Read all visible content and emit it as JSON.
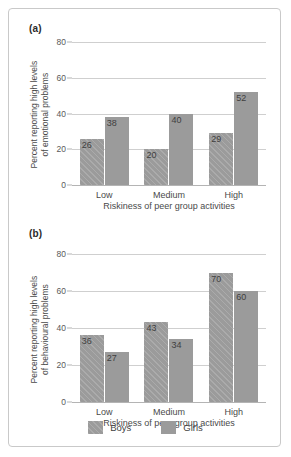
{
  "figure": {
    "panel_a_tag": "(a)",
    "panel_b_tag": "(b)",
    "legend": {
      "items": [
        {
          "label": "Boys",
          "color": "#9b9b9b",
          "pattern": "diagonal-hatch"
        },
        {
          "label": "Girls",
          "color": "#9b9b9b",
          "pattern": "solid"
        }
      ]
    }
  },
  "chart_data": [
    {
      "type": "bar",
      "panel": "(a)",
      "title": "",
      "categories": [
        "Low",
        "Medium",
        "High"
      ],
      "series": [
        {
          "name": "Boys",
          "values": [
            26,
            20,
            29
          ]
        },
        {
          "name": "Girls",
          "values": [
            38,
            40,
            52
          ]
        }
      ],
      "xlabel": "Riskiness of peer group activities",
      "ylabel_line1": "Percent reporting high levels",
      "ylabel_line2": "of emotional problems",
      "yticks": [
        0,
        20,
        40,
        60,
        80
      ],
      "ylim": [
        0,
        80
      ],
      "grid": true,
      "legend_position": "bottom"
    },
    {
      "type": "bar",
      "panel": "(b)",
      "title": "",
      "categories": [
        "Low",
        "Medium",
        "High"
      ],
      "series": [
        {
          "name": "Boys",
          "values": [
            36,
            43,
            70
          ]
        },
        {
          "name": "Girls",
          "values": [
            27,
            34,
            60
          ]
        }
      ],
      "xlabel": "Riskiness of peer group activities",
      "ylabel_line1": "Percent reporting high levels",
      "ylabel_line2": "of behavioural problems",
      "yticks": [
        0,
        20,
        40,
        60,
        80
      ],
      "ylim": [
        0,
        80
      ],
      "grid": true,
      "legend_position": "bottom"
    }
  ]
}
